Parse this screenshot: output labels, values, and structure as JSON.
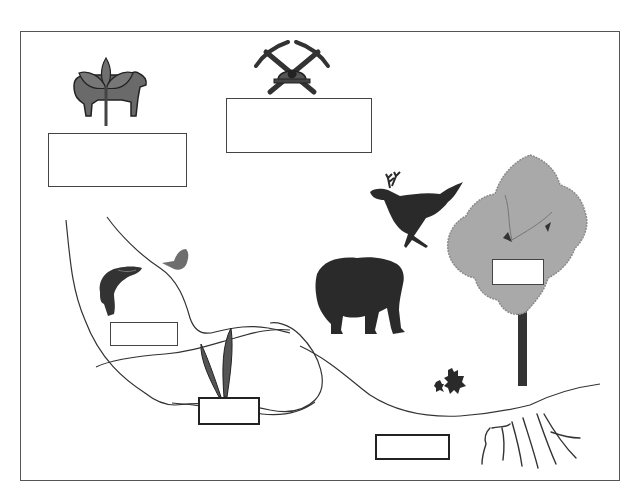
{
  "diagram": {
    "type": "ecosystem-labeling-worksheet",
    "frame": {
      "x": 20,
      "y": 31,
      "width": 600,
      "height": 450
    },
    "colors": {
      "border": "#555555",
      "icon_dark": "#2b2b2b",
      "icon_mid": "#6e6e6e",
      "foliage": "#a9a9a9",
      "line": "#333333"
    },
    "illustrations": [
      {
        "id": "agriculture",
        "description": "cow with plant sprout",
        "icon": "cow-plant-icon"
      },
      {
        "id": "mining",
        "description": "crossed pickaxes with miner helmet",
        "icon": "pickaxe-helmet-icon"
      },
      {
        "id": "deer",
        "description": "running deer silhouette",
        "icon": "deer-icon"
      },
      {
        "id": "tree",
        "description": "deciduous tree",
        "icon": "tree-icon"
      },
      {
        "id": "bear",
        "description": "bear silhouette",
        "icon": "bear-icon"
      },
      {
        "id": "fish",
        "description": "jumping salmon",
        "icon": "fish-icon"
      },
      {
        "id": "butterfly",
        "description": "butterfly / moth",
        "icon": "butterfly-icon"
      },
      {
        "id": "aquatic-plant",
        "description": "two reed leaves",
        "icon": "reed-icon"
      },
      {
        "id": "leaves",
        "description": "maple leaves",
        "icon": "maple-leaf-icon"
      },
      {
        "id": "roots",
        "description": "plant roots underground",
        "icon": "roots-icon"
      }
    ],
    "label_boxes": [
      {
        "id": "box-agriculture",
        "x": 48,
        "y": 133,
        "w": 139,
        "h": 54,
        "value": ""
      },
      {
        "id": "box-mining",
        "x": 226,
        "y": 98,
        "w": 146,
        "h": 55,
        "value": ""
      },
      {
        "id": "box-tree",
        "x": 492,
        "y": 259,
        "w": 52,
        "h": 26,
        "value": ""
      },
      {
        "id": "box-fish",
        "x": 110,
        "y": 322,
        "w": 68,
        "h": 24,
        "value": ""
      },
      {
        "id": "box-reed",
        "x": 198,
        "y": 397,
        "w": 62,
        "h": 28,
        "value": ""
      },
      {
        "id": "box-soil",
        "x": 375,
        "y": 434,
        "w": 75,
        "h": 26,
        "value": ""
      }
    ]
  }
}
